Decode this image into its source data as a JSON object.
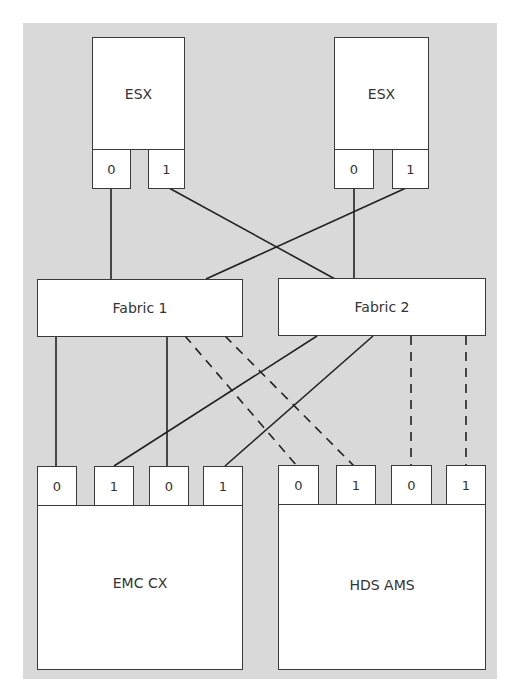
{
  "diagram": {
    "hosts": [
      {
        "label": "ESX",
        "ports": [
          "0",
          "1"
        ]
      },
      {
        "label": "ESX",
        "ports": [
          "0",
          "1"
        ]
      }
    ],
    "fabrics": [
      {
        "label": "Fabric 1"
      },
      {
        "label": "Fabric 2"
      }
    ],
    "arrays": [
      {
        "label": "EMC CX",
        "ports": [
          "0",
          "1",
          "0",
          "1"
        ]
      },
      {
        "label": "HDS AMS",
        "ports": [
          "0",
          "1",
          "0",
          "1"
        ]
      }
    ],
    "connections": [
      {
        "from": "ESX1.port0",
        "to": "Fabric 1",
        "style": "solid"
      },
      {
        "from": "ESX1.port1",
        "to": "Fabric 2",
        "style": "solid"
      },
      {
        "from": "ESX2.port0",
        "to": "Fabric 2",
        "style": "solid"
      },
      {
        "from": "ESX2.port1",
        "to": "Fabric 1",
        "style": "solid"
      },
      {
        "from": "Fabric 1",
        "to": "EMC CX.port0(1st)",
        "style": "solid"
      },
      {
        "from": "Fabric 1",
        "to": "EMC CX.port0(2nd)",
        "style": "solid"
      },
      {
        "from": "Fabric 2",
        "to": "EMC CX.port1(1st)",
        "style": "solid"
      },
      {
        "from": "Fabric 2",
        "to": "EMC CX.port1(2nd)",
        "style": "solid"
      },
      {
        "from": "Fabric 1",
        "to": "HDS AMS.port0(1st)",
        "style": "dashed"
      },
      {
        "from": "Fabric 1",
        "to": "HDS AMS.port1(1st)",
        "style": "dashed"
      },
      {
        "from": "Fabric 2",
        "to": "HDS AMS.port0(2nd)",
        "style": "dashed"
      },
      {
        "from": "Fabric 2",
        "to": "HDS AMS.port1(2nd)",
        "style": "dashed"
      }
    ],
    "colors": {
      "background": "#d9d9d9",
      "box": "#ffffff",
      "line": "#222222"
    }
  }
}
